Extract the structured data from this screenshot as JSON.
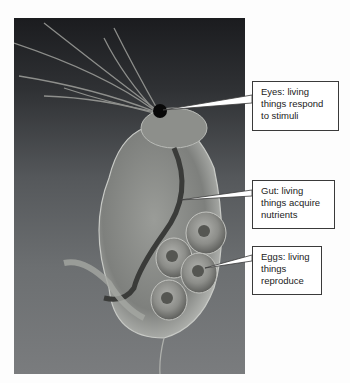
{
  "figure": {
    "background_color": "#fdfdfd",
    "callout_border_color": "#3a3a3a"
  },
  "labels": [
    {
      "id": "eyes",
      "lines": [
        "Eyes: living",
        "things respond",
        "to stimuli"
      ],
      "points_to": "eye"
    },
    {
      "id": "gut",
      "lines": [
        "Gut: living",
        "things acquire",
        "nutrients"
      ],
      "points_to": "gut"
    },
    {
      "id": "eggs",
      "lines": [
        "Eggs: living",
        "things",
        "reproduce"
      ],
      "points_to": "eggs"
    }
  ]
}
